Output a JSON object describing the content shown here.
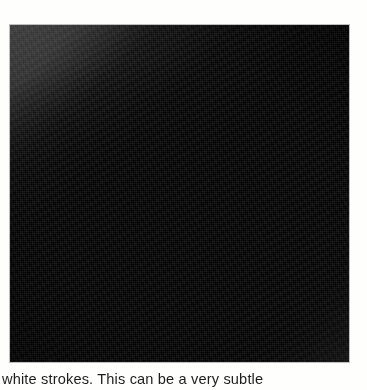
{
  "page": {
    "kind": "scanned-book-page-fragment",
    "background_color": "#fefefd"
  },
  "figure": {
    "name": "grayscale-photographic-plate",
    "alt_description": "Dark grayscale photographic plate showing a broad diagonal brush-stroke band running from the upper left to the lower right, set against a coarsely textured mid-gray ground with lighter wedges at the top-right, top-left and bottom-right corners.",
    "frame_color": "#0a0a0a",
    "tone_dark": "#000000",
    "tone_mid": "#343434",
    "tone_light": "#606060",
    "position": {
      "left": 10,
      "top": 25,
      "width": 339,
      "height": 337
    }
  },
  "body_text": {
    "clipped_line": "white strokes. This can be a very subtle",
    "text_color": "#1d1d1d"
  }
}
